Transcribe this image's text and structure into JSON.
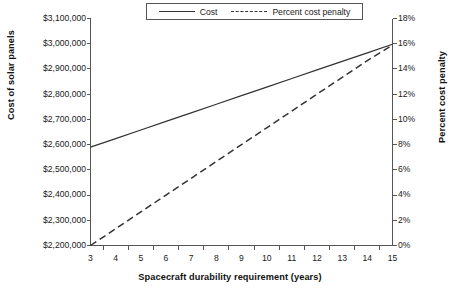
{
  "chart_data": {
    "type": "line",
    "title": "",
    "subtitle": "",
    "xlabel": "Spacecraft durability requirement (years)",
    "ylabel": "Cost of solar panels",
    "y2label": "Percent cost penalty",
    "grid": false,
    "legend_position": "top",
    "x": [
      3,
      4,
      5,
      6,
      7,
      8,
      9,
      10,
      11,
      12,
      13,
      14,
      15
    ],
    "xtick_labels": [
      "3",
      "4",
      "5",
      "6",
      "7",
      "8",
      "9",
      "10",
      "11",
      "12",
      "13",
      "14",
      "15"
    ],
    "xlim": [
      3,
      15
    ],
    "ylim": [
      2200000,
      3100000
    ],
    "ytick_labels": [
      "$2,200,000",
      "$2,300,000",
      "$2,400,000",
      "$2,500,000",
      "$2,600,000",
      "$2,700,000",
      "$2,800,000",
      "$2,900,000",
      "$3,000,000",
      "$3,100,000"
    ],
    "ytick_values": [
      2200000,
      2300000,
      2400000,
      2500000,
      2600000,
      2700000,
      2800000,
      2900000,
      3000000,
      3100000
    ],
    "y2lim": [
      0,
      18
    ],
    "y2tick_labels": [
      "0%",
      "2%",
      "4%",
      "6%",
      "8%",
      "10%",
      "12%",
      "14%",
      "16%",
      "18%"
    ],
    "y2tick_values": [
      0,
      2,
      4,
      6,
      8,
      10,
      12,
      14,
      16,
      18
    ],
    "series": [
      {
        "name": "Cost",
        "axis": "left",
        "style": "solid",
        "color": "#333333",
        "values": [
          2590000,
          2624000,
          2658000,
          2692000,
          2726000,
          2760000,
          2794000,
          2828000,
          2862000,
          2896000,
          2930000,
          2964000,
          2998000
        ]
      },
      {
        "name": "Percent cost penalty",
        "axis": "right",
        "style": "dashed",
        "color": "#333333",
        "values": [
          0.0,
          1.33,
          2.66,
          4.0,
          5.33,
          6.66,
          8.0,
          9.33,
          10.66,
          12.0,
          13.33,
          14.66,
          15.9
        ]
      }
    ],
    "legend": [
      "Cost",
      "Percent cost penalty"
    ],
    "colors": {
      "axis": "#555555",
      "text": "#1a1a1a",
      "series": "#333333"
    }
  },
  "legend": {
    "entries": [
      {
        "label": "Cost",
        "style": "solid"
      },
      {
        "label": "Percent cost penalty",
        "style": "dashed"
      }
    ]
  }
}
